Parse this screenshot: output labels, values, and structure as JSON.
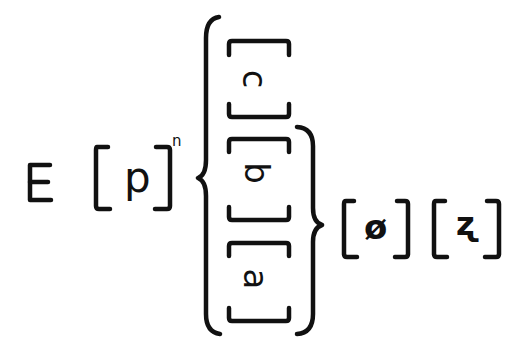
{
  "diagram": {
    "ink_color": "#111111",
    "background": "#ffffff",
    "leading_symbol": "E",
    "base": {
      "letter": "p",
      "superscript": "n"
    },
    "stack": {
      "orientation": "rotated-90",
      "items": [
        {
          "letter": "c"
        },
        {
          "letter": "b"
        },
        {
          "letter": "a"
        }
      ],
      "inner_brace_groups": [
        "b",
        "a"
      ]
    },
    "trailing": [
      {
        "symbol": "ø"
      },
      {
        "symbol": "ʐ"
      }
    ]
  }
}
